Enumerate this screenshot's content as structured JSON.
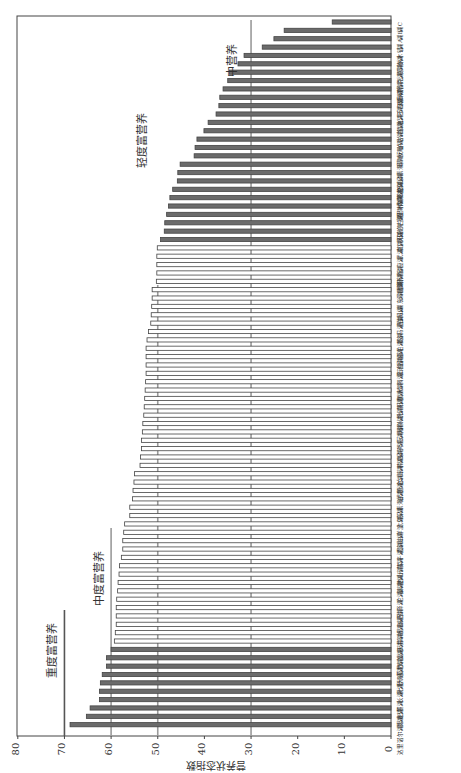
{
  "chart_data": {
    "type": "bar",
    "orientation": "vertical bars, figure rotated 90° counter-clockwise on page",
    "title": "",
    "xlabel": "",
    "ylabel": "营养状态指数",
    "ylim": [
      0,
      80
    ],
    "yticks": [
      0,
      10,
      20,
      30,
      40,
      50,
      60,
      70,
      80
    ],
    "grid": false,
    "legend": null,
    "reference_lines": [
      {
        "value": 30,
        "label": "中营养"
      },
      {
        "value": 50,
        "label": "轻度富营养"
      },
      {
        "value": 60,
        "label": "中度富营养"
      },
      {
        "value": 70,
        "label": "重度富营养"
      }
    ],
    "categories": [
      "达里诺尔湖",
      "洪湖",
      "异龙湖",
      "杞麓湖",
      "长湖",
      "滆湖",
      "七里海",
      "大通湖",
      "莫愁湖",
      "黄盖湖",
      "龙感湖",
      "天井湖",
      "高邮湖",
      "星云湖",
      "城西湖",
      "洪泽湖",
      "沱湖",
      "巢湖",
      "高唐湖",
      "杏山湖",
      "元荡湖",
      "菜子湖",
      "霞湖",
      "淀山湖",
      "白洋淀",
      "太湖",
      "东湖",
      "乌梁素海",
      "泊湖",
      "武昌湖",
      "升金湖",
      "女山湖",
      "东平湖",
      "南四湖",
      "梁子湖",
      "斧头湖",
      "瓦埠湖",
      "焦岗湖",
      "小兴凯湖",
      "长荡湖",
      "阳澄湖",
      "黄大湖",
      "南漪湖",
      "滇池",
      "石臼湖",
      "固城湖",
      "邵伯湖",
      "菱湖",
      "骆马湖",
      "西湖",
      "白马湖",
      "女山湖东",
      "沙湖",
      "洞庭湖",
      "鄱阳湖",
      "博斯腾湖",
      "宝应湖",
      "武湖",
      "南湖",
      "红枫湖",
      "阳宗海",
      "乌伦古湖",
      "程海",
      "赛里木湖",
      "青海湖",
      "呼伦湖",
      "香山湖",
      "内蒙古乌梁素海",
      "洱海",
      "清水海",
      "抚仙湖",
      "泸沽湖",
      "兴凯湖",
      "镜泊湖",
      "松花湖",
      "千岛湖",
      "天目湖",
      "喀纳斯湖",
      "可鲁克湖",
      "扎陵湖",
      "鄂陵湖",
      "纳木错"
    ],
    "values": [
      68.8,
      65.3,
      64.5,
      62.5,
      62.5,
      62.3,
      61.9,
      61.0,
      61.0,
      60.0,
      59.3,
      59.1,
      58.9,
      58.9,
      58.9,
      58.8,
      58.6,
      58.5,
      58.3,
      58.2,
      57.8,
      57.5,
      57.5,
      57.3,
      57.1,
      56.0,
      56.0,
      55.4,
      55.3,
      55.1,
      55.0,
      53.8,
      53.7,
      53.5,
      53.5,
      53.3,
      53.2,
      53.0,
      52.9,
      52.8,
      52.7,
      52.6,
      52.5,
      52.5,
      52.5,
      52.5,
      52.3,
      52.0,
      51.5,
      51.4,
      51.3,
      51.2,
      51.2,
      50.3,
      50.2,
      50.2,
      50.2,
      50.1,
      49.4,
      48.6,
      48.5,
      48.1,
      47.7,
      47.4,
      46.8,
      45.8,
      45.7,
      45.2,
      42.2,
      42.0,
      41.6,
      40.1,
      39.2,
      37.5,
      36.9,
      36.7,
      36.0,
      35.0,
      34.6,
      32.8,
      31.5,
      27.6
    ],
    "values_tail_note": "final bars (smallest) continue: 25.1, 22.9, 12.6",
    "values_all_smallest_last": [
      25.1,
      22.9,
      12.6
    ],
    "bar_fill_groups": [
      {
        "range": "values >= 60",
        "style": "dark filled"
      },
      {
        "range": "50 <= values < 60",
        "style": "hollow outline"
      },
      {
        "range": "values < 50",
        "style": "dark filled"
      }
    ]
  },
  "axis": {
    "ylabel": "营养状态指数",
    "ticks": [
      "0",
      "10",
      "20",
      "30",
      "40",
      "50",
      "60",
      "70",
      "80"
    ]
  },
  "labels": {
    "mesotrophic": "中营养",
    "light_eutrophic": "轻度富营养",
    "moderate_eutrophic": "中度富营养",
    "severe_eutrophic": "重度富营养"
  },
  "colors": {
    "bar_dark": "#6b6b6b",
    "bar_outline": "#444444",
    "ref_line": "#9a9a9a",
    "axis": "#444444"
  }
}
